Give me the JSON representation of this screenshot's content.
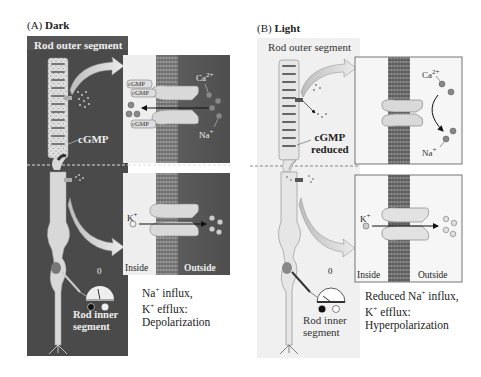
{
  "figure": {
    "panels": [
      {
        "id": "A",
        "prefix": "(A)",
        "title": "Dark",
        "outer_segment_label": "Rod outer segment",
        "cgmp_label": "cGMP",
        "inner_segment_label_1": "Rod inner",
        "inner_segment_label_2": "segment",
        "meter_zero": "0",
        "meter_minus": "−",
        "meter_plus": "+",
        "top_box": {
          "cgmp_tags": [
            "cGMP",
            "cGMP",
            "cGMP"
          ],
          "ion_top": "Ca",
          "ion_top_charge": "2+",
          "ion_bottom": "Na",
          "ion_bottom_charge": "+"
        },
        "bottom_box": {
          "ion": "K",
          "ion_charge": "+",
          "inside_label": "Inside",
          "outside_label": "Outside"
        },
        "caption_lines": [
          {
            "ion": "Na",
            "charge": "+",
            "text": " influx,"
          },
          {
            "ion": "K",
            "charge": "+",
            "text": " efflux:"
          },
          {
            "ion": "",
            "charge": "",
            "text": "Depolarization"
          }
        ],
        "colors": {
          "background": "#4a4a4a",
          "outside": "#5b5b5b",
          "inside": "#eeeeee"
        }
      },
      {
        "id": "B",
        "prefix": "(B)",
        "title": "Light",
        "outer_segment_label": "Rod outer segment",
        "cgmp_label_1": "cGMP",
        "cgmp_label_2": "reduced",
        "inner_segment_label_1": "Rod inner",
        "inner_segment_label_2": "segment",
        "meter_zero": "0",
        "meter_minus": "−",
        "meter_plus": "+",
        "top_box": {
          "ion_top": "Ca",
          "ion_top_charge": "2+",
          "ion_bottom": "Na",
          "ion_bottom_charge": "+"
        },
        "bottom_box": {
          "ion": "K",
          "ion_charge": "+",
          "inside_label": "Inside",
          "outside_label": "Outside"
        },
        "caption_lines": [
          {
            "ion": "Reduced Na",
            "charge": "+",
            "text": " influx,"
          },
          {
            "ion": "K",
            "charge": "+",
            "text": " efflux:"
          },
          {
            "ion": "",
            "charge": "",
            "text": "Hyperpolarization"
          }
        ],
        "colors": {
          "background": "#f0f0f0",
          "outside": "#f6f6f6",
          "inside": "#f6f6f6"
        }
      }
    ]
  }
}
